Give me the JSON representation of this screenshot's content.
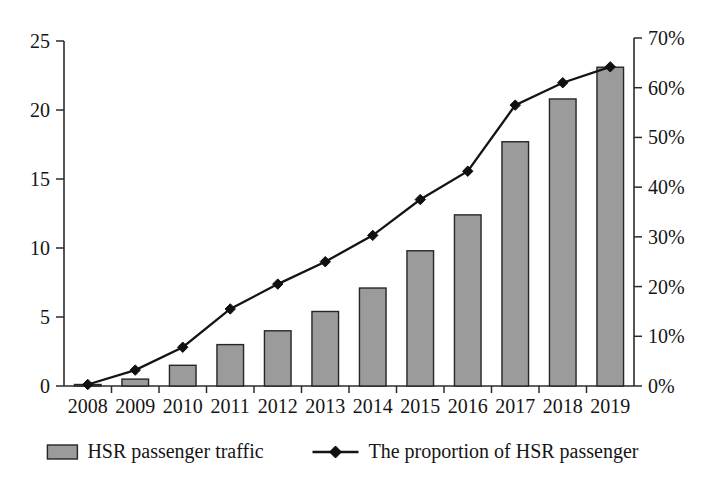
{
  "chart_data": {
    "type": "bar",
    "title": "",
    "subtitle": "",
    "xlabel": "",
    "ylabel": "",
    "grid": false,
    "legend_position": "bottom",
    "categories": [
      "2008",
      "2009",
      "2010",
      "2011",
      "2012",
      "2013",
      "2014",
      "2015",
      "2016",
      "2017",
      "2018",
      "2019"
    ],
    "series": [
      {
        "name": "HSR passenger traffic",
        "type": "bar",
        "axis": "left",
        "values": [
          0.1,
          0.5,
          1.5,
          3.0,
          4.0,
          5.4,
          7.1,
          9.8,
          12.4,
          17.7,
          20.8,
          23.1
        ]
      },
      {
        "name": "The proportion of HSR passenger",
        "type": "line",
        "axis": "right",
        "marker": "diamond",
        "values": [
          0.3,
          3.2,
          7.8,
          15.5,
          20.5,
          25.0,
          30.3,
          37.5,
          43.2,
          56.5,
          61.0,
          64.2
        ]
      }
    ],
    "left_axis": {
      "min": 0,
      "max": 25,
      "step": 5,
      "ticks": [
        "0",
        "5",
        "10",
        "15",
        "20",
        "25"
      ]
    },
    "right_axis": {
      "min": 0,
      "max": 70,
      "step": 10,
      "ticks": [
        "0%",
        "10%",
        "20%",
        "30%",
        "40%",
        "50%",
        "60%",
        "70%"
      ]
    }
  },
  "legend": {
    "items": [
      {
        "label": "HSR passenger traffic",
        "marker": "bar-swatch",
        "color": "#9b9b9b"
      },
      {
        "label": "The proportion of HSR passenger",
        "marker": "line-diamond",
        "color": "#141414"
      }
    ]
  },
  "colors": {
    "bar_fill": "#9b9b9b",
    "bar_stroke": "#262626",
    "line": "#141414",
    "axis": "#2b2b2b",
    "text": "#151515",
    "background": "#ffffff"
  }
}
